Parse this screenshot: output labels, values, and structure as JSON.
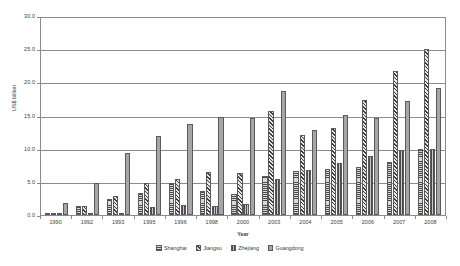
{
  "chart_data": {
    "type": "bar",
    "title": "",
    "xlabel": "Year",
    "ylabel": "US$ billion",
    "ylim": [
      0,
      30
    ],
    "ytick_step": 5,
    "ytick_labels": [
      "0.0",
      "5.0",
      "10.0",
      "15.0",
      "20.0",
      "25.0",
      "30.0"
    ],
    "grid": "horizontal",
    "legend_position": "bottom",
    "categories": [
      "1990",
      "1992",
      "1993",
      "1995",
      "1996",
      "1998",
      "2000",
      "2003",
      "2004",
      "2005",
      "2006",
      "2007",
      "2008"
    ],
    "series": [
      {
        "name": "Shanghai",
        "pattern": "horizontal-lines",
        "color": "#d9d9d9",
        "values": [
          0.1,
          1.3,
          2.4,
          3.3,
          4.8,
          3.7,
          3.2,
          5.9,
          6.7,
          7.0,
          7.3,
          8.1,
          10.1
        ]
      },
      {
        "name": "Jiangsu",
        "pattern": "diagonal-hatch",
        "color": "#e6e6e6",
        "values": [
          0.1,
          1.4,
          2.9,
          4.8,
          5.5,
          6.5,
          6.4,
          15.9,
          12.2,
          13.2,
          17.5,
          21.9,
          25.3
        ]
      },
      {
        "name": "Zhejiang",
        "pattern": "vertical-lines",
        "color": "#c9c9c9",
        "values": [
          0.0,
          0.2,
          0.3,
          1.2,
          1.6,
          1.3,
          1.7,
          5.5,
          6.8,
          7.9,
          9.0,
          9.9,
          10.1
        ]
      },
      {
        "name": "Guangdong",
        "pattern": "solid",
        "color": "#a6a6a6",
        "values": [
          1.9,
          4.8,
          9.5,
          12.1,
          13.9,
          15.0,
          14.7,
          18.9,
          13.0,
          15.3,
          14.7,
          17.3,
          19.3
        ]
      }
    ]
  },
  "legend": {
    "items": [
      {
        "label": "Shanghai"
      },
      {
        "label": "Jiangsu"
      },
      {
        "label": "Zhejiang"
      },
      {
        "label": "Guangdong"
      }
    ]
  }
}
